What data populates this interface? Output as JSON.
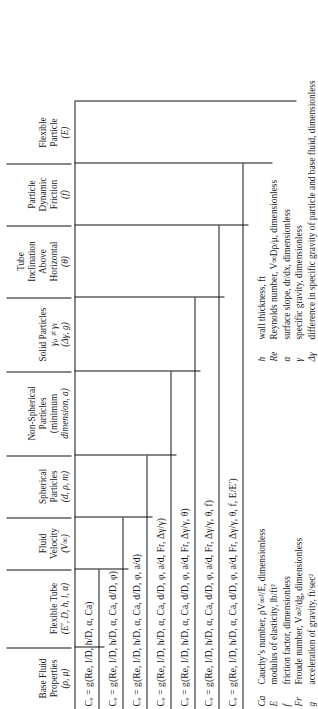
{
  "figure": {
    "orientation": "rotated-90-ccw",
    "type": "nested-variable-table"
  },
  "columns": [
    {
      "name": "base-fluid-properties",
      "lines": [
        "Base Fluid",
        "Properties",
        "(ρ, μ)"
      ]
    },
    {
      "name": "flexible-tube",
      "lines": [
        "Flexible Tube",
        "(E′, D, h, l, α)"
      ]
    },
    {
      "name": "fluid-velocity",
      "lines": [
        "Fluid",
        "Velocity",
        "(V∞)"
      ]
    },
    {
      "name": "spherical-particles",
      "lines": [
        "Spherical",
        "Particles",
        "(d, ρ, m)"
      ]
    },
    {
      "name": "non-spherical-particles",
      "lines": [
        "Non-Spherical",
        "Particles",
        "(minimum",
        "dimension, a)"
      ]
    },
    {
      "name": "solid-particles",
      "lines": [
        "Solid Particles",
        "γₚ ≠ γₗ",
        "(Δγ, g)"
      ]
    },
    {
      "name": "tube-inclination",
      "lines": [
        "Tube",
        "Inclination",
        "Above",
        "Horizontal",
        "(θ)"
      ]
    },
    {
      "name": "particle-dynamic-friction",
      "lines": [
        "Particle",
        "Dynamic",
        "Friction",
        "(f)"
      ]
    },
    {
      "name": "flexible-particle",
      "lines": [
        "Flexible",
        "Particle",
        "(E)"
      ]
    }
  ],
  "equations": [
    {
      "id": "eq-1",
      "text": "Cₑ = g(Re, l/D, h/D, α, Ca)"
    },
    {
      "id": "eq-2",
      "text": "Cₑ = g(Re, l/D, h/D, α, Ca, d/D, φ)"
    },
    {
      "id": "eq-3",
      "text": "Cₑ = g(Re, l/D, h/D, α, Ca, d/D, φ, a/d)"
    },
    {
      "id": "eq-4",
      "text": "Cₑ = g(Re, l/D, h/D, α, Ca, d/D, φ, a/d, Fr, Δγ/γ)"
    },
    {
      "id": "eq-5",
      "text": "Cₑ = g(Re, l/D, h/D, α, Ca, d/D, φ, a/d, Fr, Δγ/γ, θ)"
    },
    {
      "id": "eq-6",
      "text": "Cₑ = g(Re, l/D, h/D, α, Ca, d/D, φ, a/d, Fr, Δγ/γ, θ, f)"
    },
    {
      "id": "eq-7",
      "text": "Cₑ = g(Re, l/D, h/D, α, Ca, d/D, φ, a/d, Fr, Δγ/γ, θ, f, E/E′)"
    }
  ],
  "legend": {
    "column_left": [
      {
        "symbol": "Ca",
        "desc": "Cauchy’s number, ρV∞²/E, dimensionless"
      },
      {
        "symbol": "E",
        "desc": "modulus of elasticity, lb/ft²"
      },
      {
        "symbol": "f",
        "desc": "friction factor, dimensionless"
      },
      {
        "symbol": "Fr",
        "desc": "Froude number, V∞²/dg, dimensionless"
      },
      {
        "symbol": "g",
        "desc": "acceleration of gravity, ft/sec²"
      }
    ],
    "column_right": [
      {
        "symbol": "h",
        "desc": "wall thickness, ft"
      },
      {
        "symbol": "Re",
        "desc": "Reynolds number, V∞Dρ/μ, dimensionless"
      },
      {
        "symbol": "α",
        "desc": "surface slope, dr/dx, dimensionless"
      },
      {
        "symbol": "γ",
        "desc": "specific gravity, dimensionless"
      },
      {
        "symbol": "Δγ",
        "desc": "difference in specific gravity of particle and base fluid, dimensionless"
      }
    ]
  }
}
